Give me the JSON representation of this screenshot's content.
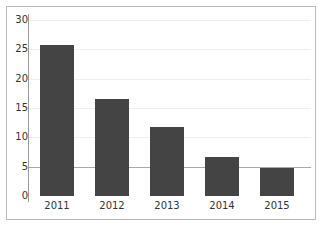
{
  "chart_data": {
    "type": "bar",
    "title": "",
    "subtitle": "",
    "xlabel": "",
    "ylabel": "",
    "categories": [
      "2011",
      "2012",
      "2013",
      "2014",
      "2015"
    ],
    "values": [
      25.8,
      16.5,
      11.8,
      6.7,
      4.7
    ],
    "series": [
      {
        "name": "",
        "values": [
          25.8,
          16.5,
          11.8,
          6.7,
          4.7
        ]
      }
    ],
    "ylim": [
      0,
      30
    ],
    "y_ticks": [
      0,
      5,
      10,
      15,
      20,
      25,
      30
    ],
    "y_tick_labels": [
      "0",
      "5",
      "10",
      "15",
      "20",
      "25",
      "30"
    ],
    "grid": true,
    "grid_axis": "y",
    "legend": false,
    "legend_position": "none",
    "annotations": [],
    "colors": {
      "bar": "#444444",
      "grid": "#eeeeee",
      "grid_major": "#a8a8a8",
      "axis": "#9a9a9a",
      "frame": "#b9b9b9",
      "text": "#333333",
      "background": "#ffffff"
    }
  }
}
